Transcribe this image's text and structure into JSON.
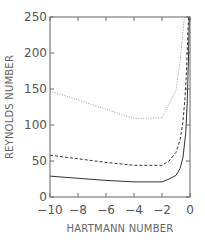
{
  "chart_data": {
    "type": "line",
    "title": "",
    "xlabel": "HARTMANN NUMBER",
    "ylabel": "REYNOLDS NUMBER",
    "xlim": [
      -10,
      0
    ],
    "ylim": [
      0,
      250
    ],
    "xticks": [
      -10,
      -8,
      -6,
      -4,
      -2,
      0
    ],
    "yticks": [
      0,
      50,
      100,
      150,
      200,
      250
    ],
    "xtick_labels": [
      "−10",
      "−8",
      "−6",
      "−4",
      "−2",
      "0"
    ],
    "ytick_labels": [
      "0",
      "50",
      "100",
      "150",
      "200",
      "250"
    ],
    "grid": false,
    "legend": null,
    "series": [
      {
        "name": "solid",
        "style": "solid",
        "color": "#333333",
        "x": [
          -10,
          -8,
          -6,
          -4,
          -2,
          -1.5,
          -1,
          -0.7,
          -0.5,
          -0.3,
          -0.2,
          -0.1,
          -0.05
        ],
        "y": [
          29,
          26,
          23,
          21,
          21,
          25,
          30,
          40,
          55,
          90,
          130,
          200,
          250
        ]
      },
      {
        "name": "dashed",
        "style": "dashed",
        "color": "#333333",
        "x": [
          -10,
          -8,
          -6,
          -4,
          -2,
          -1.5,
          -1,
          -0.7,
          -0.5,
          -0.35,
          -0.25,
          -0.15,
          -0.1
        ],
        "y": [
          58,
          53,
          48,
          44,
          44,
          50,
          62,
          80,
          105,
          140,
          175,
          230,
          250
        ]
      },
      {
        "name": "dotted",
        "style": "dotted",
        "color": "#999999",
        "x": [
          -10,
          -8,
          -6,
          -4,
          -2,
          -1,
          -0.7,
          -0.5,
          -0.4
        ],
        "y": [
          147,
          135,
          122,
          109,
          110,
          148,
          190,
          230,
          250
        ]
      }
    ]
  }
}
